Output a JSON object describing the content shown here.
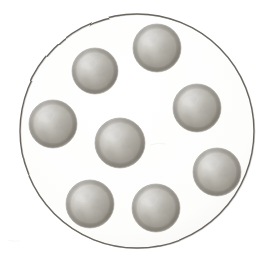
{
  "figure": {
    "title": "Hand-drawn stippled illustration",
    "description": "A large pencil-drawn outline circle containing eight small shaded spheres",
    "caption": "",
    "medium": "pencil-stipple",
    "canvas": {
      "width": 271,
      "height": 268,
      "background_color": "#ffffff"
    },
    "outline_circle": {
      "label": "enclosing-circle",
      "center_x": 137,
      "center_y": 131,
      "radius": 117,
      "stroke_color": "#5a564f",
      "stroke_width": 1.4,
      "fill_color": "#fdfdfc"
    },
    "sphere_style": {
      "base_color": "#b9b6ae",
      "shadow_color": "#8e8a82",
      "highlight_color": "#f3f2ef",
      "edge_color": "#a09c94",
      "light_direction": "top-left",
      "texture": "stipple-grain"
    },
    "sphere_count": 8,
    "spheres": [
      {
        "label": "sphere-top",
        "cx": 157,
        "cy": 48,
        "r": 24
      },
      {
        "label": "sphere-upper-left",
        "cx": 95,
        "cy": 71,
        "r": 23
      },
      {
        "label": "sphere-left",
        "cx": 53,
        "cy": 124,
        "r": 24
      },
      {
        "label": "sphere-upper-right",
        "cx": 197,
        "cy": 108,
        "r": 24
      },
      {
        "label": "sphere-center",
        "cx": 120,
        "cy": 143,
        "r": 25
      },
      {
        "label": "sphere-lower-right",
        "cx": 217,
        "cy": 172,
        "r": 24
      },
      {
        "label": "sphere-bottom-left",
        "cx": 90,
        "cy": 204,
        "r": 24
      },
      {
        "label": "sphere-bottom-center",
        "cx": 156,
        "cy": 208,
        "r": 24
      }
    ]
  }
}
